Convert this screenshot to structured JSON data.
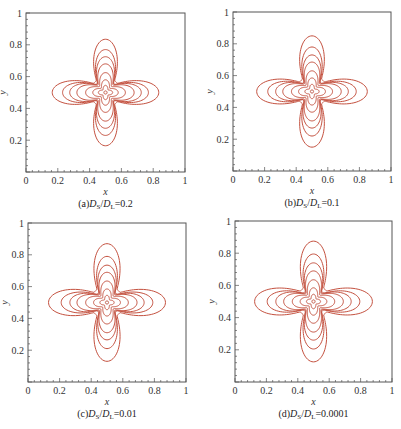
{
  "figure": {
    "contour_color": "#c4513f",
    "frame_color": "#555555"
  },
  "chart_data": [
    {
      "type": "contour",
      "id": "a",
      "caption": {
        "prefix": "(a)",
        "num_sym": "D",
        "num_sub": "S",
        "den_sym": "D",
        "den_sub": "L",
        "value": "=0.2"
      },
      "xlabel": "x",
      "ylabel": "y",
      "xlim": [
        0,
        1
      ],
      "ylim": [
        0,
        1
      ],
      "xticks": [
        "0",
        "0.2",
        "0.4",
        "0.6",
        "0.8",
        "1"
      ],
      "yticks": [
        "0.2",
        "0.4",
        "0.6",
        "0.8",
        "1"
      ],
      "grid": false,
      "center": [
        0.5,
        0.5
      ],
      "contour_extents": [
        0.335,
        0.27,
        0.225,
        0.18,
        0.125,
        0.08,
        0.045,
        0.01
      ],
      "frame_px": {
        "left": 26,
        "top": 13,
        "right": 185,
        "bottom": 172
      }
    },
    {
      "type": "contour",
      "id": "b",
      "caption": {
        "prefix": "(b)",
        "num_sym": "D",
        "num_sub": "S",
        "den_sym": "D",
        "den_sub": "L",
        "value": "=0.1"
      },
      "xlabel": "x",
      "ylabel": "y",
      "xlim": [
        0,
        1
      ],
      "ylim": [
        0,
        1
      ],
      "xticks": [
        "0",
        "0.2",
        "0.4",
        "0.6",
        "0.8",
        "1"
      ],
      "yticks": [
        "0.2",
        "0.4",
        "0.6",
        "0.8",
        "1"
      ],
      "grid": false,
      "center": [
        0.5,
        0.5
      ],
      "contour_extents": [
        0.35,
        0.28,
        0.23,
        0.185,
        0.13,
        0.085,
        0.045,
        0.01
      ],
      "frame_px": {
        "left": 233,
        "top": 12,
        "right": 391,
        "bottom": 171
      }
    },
    {
      "type": "contour",
      "id": "c",
      "caption": {
        "prefix": "(c)",
        "num_sym": "D",
        "num_sub": "S",
        "den_sym": "D",
        "den_sub": "L",
        "value": "=0.01"
      },
      "xlabel": "x",
      "ylabel": "y",
      "xlim": [
        0,
        1
      ],
      "ylim": [
        0,
        1
      ],
      "xticks": [
        "0",
        "0.2",
        "0.4",
        "0.6",
        "0.8",
        "1"
      ],
      "yticks": [
        "0.2",
        "0.4",
        "0.6",
        "0.8",
        "1"
      ],
      "grid": false,
      "center": [
        0.5,
        0.5
      ],
      "contour_extents": [
        0.37,
        0.29,
        0.235,
        0.19,
        0.135,
        0.085,
        0.045,
        0.01
      ],
      "frame_px": {
        "left": 28,
        "top": 223,
        "right": 186,
        "bottom": 382
      }
    },
    {
      "type": "contour",
      "id": "d",
      "caption": {
        "prefix": "(d)",
        "num_sym": "D",
        "num_sub": "S",
        "den_sym": "D",
        "den_sub": "L",
        "value": "=0.0001"
      },
      "xlabel": "x",
      "ylabel": "y",
      "xlim": [
        0,
        1
      ],
      "ylim": [
        0,
        1
      ],
      "xticks": [
        "0",
        "0.2",
        "0.4",
        "0.6",
        "0.8",
        "1"
      ],
      "yticks": [
        "0.2",
        "0.4",
        "0.6",
        "0.8",
        "1"
      ],
      "grid": false,
      "center": [
        0.5,
        0.5
      ],
      "contour_extents": [
        0.375,
        0.295,
        0.24,
        0.19,
        0.135,
        0.085,
        0.045,
        0.01
      ],
      "frame_px": {
        "left": 235,
        "top": 221,
        "right": 392,
        "bottom": 382
      }
    }
  ]
}
